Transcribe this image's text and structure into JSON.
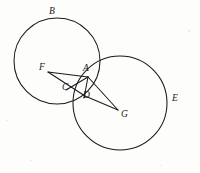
{
  "figure": {
    "type": "geometry-diagram",
    "canvas": {
      "width": 200,
      "height": 173,
      "background": "#fdfdfb"
    },
    "stroke_color": "#1a1a1a",
    "label_color": "#1a1a1a",
    "circles": [
      {
        "name": "circle-B",
        "label": "B",
        "cx": 57,
        "cy": 61,
        "r": 43,
        "label_x": 49,
        "label_y": 7
      },
      {
        "name": "circle-E",
        "label": "E",
        "cx": 120,
        "cy": 103,
        "r": 47,
        "label_x": 172,
        "label_y": 94
      }
    ],
    "points": [
      {
        "name": "point-A",
        "label": "A",
        "x": 87,
        "y": 77,
        "label_x": 83,
        "label_y": 64
      },
      {
        "name": "point-B",
        "label": "B",
        "x": 52,
        "y": 18,
        "label_x": 49,
        "label_y": 7
      },
      {
        "name": "point-C",
        "label": "C",
        "x": 69,
        "y": 88,
        "label_x": 62,
        "label_y": 83
      },
      {
        "name": "point-D",
        "label": "D",
        "x": 84,
        "y": 96,
        "label_x": 83,
        "label_y": 91
      },
      {
        "name": "point-E",
        "label": "E",
        "x": 167,
        "y": 103,
        "label_x": 172,
        "label_y": 94
      },
      {
        "name": "point-F",
        "label": "F",
        "x": 48,
        "y": 72,
        "label_x": 39,
        "label_y": 63
      },
      {
        "name": "point-G",
        "label": "G",
        "x": 118,
        "y": 110,
        "label_x": 121,
        "label_y": 110
      }
    ],
    "segments": [
      {
        "name": "segment-FA",
        "from": "F",
        "to": "A",
        "x1": 48,
        "y1": 72,
        "x2": 88,
        "y2": 77
      },
      {
        "name": "segment-FD",
        "from": "F",
        "to": "D",
        "x1": 48,
        "y1": 72,
        "x2": 85,
        "y2": 96
      },
      {
        "name": "segment-AG",
        "from": "A",
        "to": "G",
        "x1": 88,
        "y1": 77,
        "x2": 118,
        "y2": 110
      },
      {
        "name": "segment-DG",
        "from": "D",
        "to": "G",
        "x1": 85,
        "y1": 96,
        "x2": 118,
        "y2": 110
      },
      {
        "name": "segment-AD",
        "from": "A",
        "to": "D",
        "x1": 88,
        "y1": 77,
        "x2": 84,
        "y2": 98
      },
      {
        "name": "segment-AC",
        "from": "A",
        "to": "C",
        "x1": 88,
        "y1": 77,
        "x2": 66,
        "y2": 90
      }
    ]
  }
}
